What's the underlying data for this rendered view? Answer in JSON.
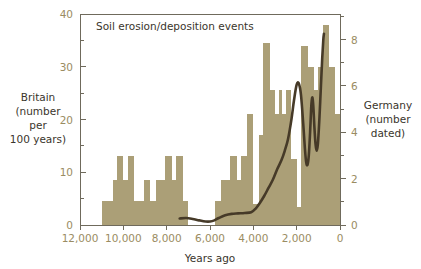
{
  "chart_data": {
    "type": "bar",
    "title": "Soil erosion/deposition events",
    "xlabel": "Years ago",
    "xlim": [
      12000,
      0
    ],
    "x_ticks": [
      12000,
      10000,
      8000,
      6000,
      4000,
      2000,
      0
    ],
    "x_tick_labels": [
      "12,000",
      "10,000",
      "8,000",
      "6,000",
      "4,000",
      "2,000",
      "0"
    ],
    "ylabel_left": "Britain\n(number\nper\n100 years)",
    "ylabel_left_lines": [
      "Britain",
      "(number",
      "per",
      "100 years)"
    ],
    "ylim_left": [
      0,
      40
    ],
    "y_ticks_left": [
      0,
      10,
      20,
      30,
      40
    ],
    "y_tick_labels_left": [
      "0",
      "10",
      "20",
      "30",
      "40"
    ],
    "y_minor_ticks_left": [
      5,
      15,
      25,
      35
    ],
    "ylabel_right": "Germany\n(number\ndated)",
    "ylabel_right_lines": [
      "Germany",
      "(number",
      "dated)"
    ],
    "ylim_right": [
      0,
      9.1
    ],
    "y_ticks_right": [
      0,
      2,
      4,
      6,
      8
    ],
    "y_tick_labels_right": [
      "0",
      "2",
      "4",
      "6",
      "8"
    ],
    "y_minor_ticks_right": [
      1,
      3,
      5,
      7,
      9
    ],
    "grid": false,
    "legend": "none",
    "bar_color": "#ab9f77",
    "line_color": "#463a28",
    "axis_color": "#6f6a5c",
    "tick_text_color": "#9a8c62",
    "series": [
      {
        "name": "Britain soil erosion/deposition events (number per 100 years)",
        "axis": "left",
        "type": "step-histogram",
        "bin_width_years": 250,
        "bins": [
          {
            "x_start": 11250,
            "x_end": 11000,
            "value": 0
          },
          {
            "x_start": 11000,
            "x_end": 10750,
            "value": 4.5
          },
          {
            "x_start": 10750,
            "x_end": 10500,
            "value": 4.5
          },
          {
            "x_start": 10500,
            "x_end": 10250,
            "value": 8.5
          },
          {
            "x_start": 10250,
            "x_end": 10000,
            "value": 13
          },
          {
            "x_start": 10000,
            "x_end": 9750,
            "value": 8.5
          },
          {
            "x_start": 9750,
            "x_end": 9500,
            "value": 13
          },
          {
            "x_start": 9500,
            "x_end": 9250,
            "value": 4.5
          },
          {
            "x_start": 9250,
            "x_end": 9000,
            "value": 4.5
          },
          {
            "x_start": 9000,
            "x_end": 8750,
            "value": 8.5
          },
          {
            "x_start": 8750,
            "x_end": 8500,
            "value": 4.5
          },
          {
            "x_start": 8500,
            "x_end": 8250,
            "value": 8.5
          },
          {
            "x_start": 8250,
            "x_end": 8000,
            "value": 8.5
          },
          {
            "x_start": 8000,
            "x_end": 7750,
            "value": 13
          },
          {
            "x_start": 7750,
            "x_end": 7500,
            "value": 8.5
          },
          {
            "x_start": 7500,
            "x_end": 7250,
            "value": 13
          },
          {
            "x_start": 7250,
            "x_end": 7000,
            "value": 4.5
          },
          {
            "x_start": 7000,
            "x_end": 6750,
            "value": 0
          },
          {
            "x_start": 6750,
            "x_end": 6500,
            "value": 0
          },
          {
            "x_start": 6500,
            "x_end": 6250,
            "value": 0
          },
          {
            "x_start": 6250,
            "x_end": 6000,
            "value": 0
          },
          {
            "x_start": 6000,
            "x_end": 5750,
            "value": 0
          },
          {
            "x_start": 5750,
            "x_end": 5500,
            "value": 4.5
          },
          {
            "x_start": 5500,
            "x_end": 5250,
            "value": 8.5
          },
          {
            "x_start": 5250,
            "x_end": 5000,
            "value": 8.5
          },
          {
            "x_start": 5000,
            "x_end": 4750,
            "value": 13
          },
          {
            "x_start": 4750,
            "x_end": 4500,
            "value": 8.5
          },
          {
            "x_start": 4500,
            "x_end": 4250,
            "value": 13
          },
          {
            "x_start": 4250,
            "x_end": 4000,
            "value": 21
          },
          {
            "x_start": 4000,
            "x_end": 3750,
            "value": 4
          },
          {
            "x_start": 3750,
            "x_end": 3500,
            "value": 17
          },
          {
            "x_start": 3500,
            "x_end": 3250,
            "value": 34.5
          },
          {
            "x_start": 3250,
            "x_end": 3000,
            "value": 25.5
          },
          {
            "x_start": 3000,
            "x_end": 2750,
            "value": 21
          },
          {
            "x_start": 2750,
            "x_end": 2500,
            "value": 21
          },
          {
            "x_start": 2500,
            "x_end": 2250,
            "value": 25.5
          },
          {
            "x_start": 2250,
            "x_end": 2000,
            "value": 12.5
          },
          {
            "x_start": 2000,
            "x_end": 1750,
            "value": 3.5
          },
          {
            "x_start": 1750,
            "x_end": 1500,
            "value": 34
          },
          {
            "x_start": 1500,
            "x_end": 1250,
            "value": 30
          },
          {
            "x_start": 1250,
            "x_end": 1000,
            "value": 25.5
          },
          {
            "x_start": 1000,
            "x_end": 750,
            "value": 30
          },
          {
            "x_start": 750,
            "x_end": 500,
            "value": 38
          },
          {
            "x_start": 500,
            "x_end": 250,
            "value": 30
          },
          {
            "x_start": 250,
            "x_end": 0,
            "value": 21
          }
        ],
        "spikes": [
          {
            "x": 10250,
            "value": 13
          },
          {
            "x": 9750,
            "value": 13
          },
          {
            "x": 9000,
            "value": 8.5
          },
          {
            "x": 8000,
            "value": 13
          },
          {
            "x": 7500,
            "value": 13
          },
          {
            "x": 5000,
            "value": 13
          },
          {
            "x": 4500,
            "value": 13
          },
          {
            "x": 4250,
            "value": 21
          },
          {
            "x": 3500,
            "value": 34.5
          },
          {
            "x": 2750,
            "value": 25.5
          },
          {
            "x": 1750,
            "value": 34
          },
          {
            "x": 1250,
            "value": 30
          },
          {
            "x": 750,
            "value": 38
          }
        ]
      },
      {
        "name": "Germany dated events (number dated)",
        "axis": "right",
        "type": "line",
        "points": [
          {
            "x": 7400,
            "y": 0.28
          },
          {
            "x": 7100,
            "y": 0.3
          },
          {
            "x": 6800,
            "y": 0.26
          },
          {
            "x": 6500,
            "y": 0.2
          },
          {
            "x": 6200,
            "y": 0.15
          },
          {
            "x": 6000,
            "y": 0.15
          },
          {
            "x": 5800,
            "y": 0.2
          },
          {
            "x": 5600,
            "y": 0.3
          },
          {
            "x": 5300,
            "y": 0.42
          },
          {
            "x": 5000,
            "y": 0.48
          },
          {
            "x": 4700,
            "y": 0.5
          },
          {
            "x": 4400,
            "y": 0.52
          },
          {
            "x": 4100,
            "y": 0.55
          },
          {
            "x": 3900,
            "y": 0.7
          },
          {
            "x": 3700,
            "y": 0.95
          },
          {
            "x": 3500,
            "y": 1.25
          },
          {
            "x": 3300,
            "y": 1.6
          },
          {
            "x": 3100,
            "y": 1.95
          },
          {
            "x": 2900,
            "y": 2.4
          },
          {
            "x": 2700,
            "y": 2.8
          },
          {
            "x": 2550,
            "y": 3.2
          },
          {
            "x": 2400,
            "y": 3.7
          },
          {
            "x": 2250,
            "y": 4.5
          },
          {
            "x": 2120,
            "y": 5.4
          },
          {
            "x": 2000,
            "y": 6.05
          },
          {
            "x": 1900,
            "y": 6.1
          },
          {
            "x": 1800,
            "y": 5.6
          },
          {
            "x": 1700,
            "y": 4.4
          },
          {
            "x": 1620,
            "y": 3.3
          },
          {
            "x": 1560,
            "y": 2.7
          },
          {
            "x": 1500,
            "y": 2.6
          },
          {
            "x": 1440,
            "y": 3.0
          },
          {
            "x": 1380,
            "y": 4.0
          },
          {
            "x": 1320,
            "y": 5.2
          },
          {
            "x": 1270,
            "y": 5.5
          },
          {
            "x": 1230,
            "y": 5.1
          },
          {
            "x": 1180,
            "y": 4.2
          },
          {
            "x": 1130,
            "y": 3.5
          },
          {
            "x": 1080,
            "y": 3.2
          },
          {
            "x": 1020,
            "y": 3.5
          },
          {
            "x": 950,
            "y": 4.6
          },
          {
            "x": 880,
            "y": 6.0
          },
          {
            "x": 820,
            "y": 7.2
          },
          {
            "x": 770,
            "y": 8.0
          },
          {
            "x": 740,
            "y": 8.25
          }
        ]
      }
    ]
  },
  "chart": {
    "title": "Soil erosion/deposition events",
    "xlabel": "Years ago",
    "left_label_lines": [
      "Britain",
      "(number",
      "per",
      "100 years)"
    ],
    "right_label_lines": [
      "Germany",
      "(number",
      "dated)"
    ]
  }
}
